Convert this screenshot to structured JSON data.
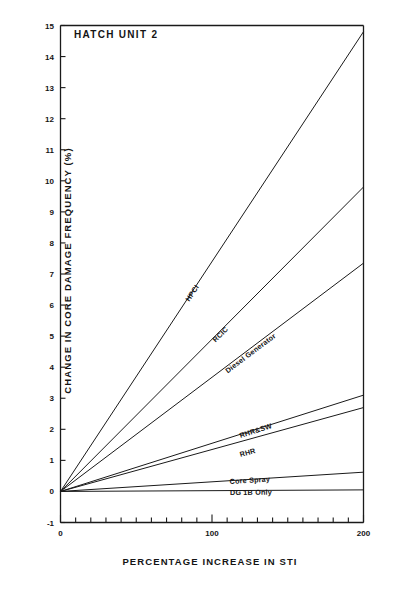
{
  "figure": {
    "plot_title": "HATCH UNIT 2",
    "x_axis_title": "PERCENTAGE INCREASE IN STI",
    "y_axis_title": "CHANGE IN CORE DAMAGE FREQUENCY  (%)",
    "line_color": "#1a1a1a",
    "axis_color": "#1a1a1a",
    "background": "#ffffff"
  },
  "chart_data": {
    "type": "line",
    "title": "HATCH UNIT 2",
    "xlabel": "PERCENTAGE INCREASE IN STI",
    "ylabel": "CHANGE IN CORE DAMAGE FREQUENCY  (%)",
    "xlim": [
      0,
      200
    ],
    "ylim": [
      -1,
      15
    ],
    "xticks": [
      0,
      100,
      200
    ],
    "xtick_labels": [
      "0",
      "100",
      "200"
    ],
    "xminor_step": 10,
    "yticks": [
      -1,
      0,
      1,
      2,
      3,
      4,
      5,
      6,
      7,
      8,
      9,
      10,
      11,
      12,
      13,
      14,
      15
    ],
    "ytick_labels": [
      "-1",
      "0",
      "1",
      "2",
      "3",
      "4",
      "5",
      "6",
      "7",
      "8",
      "9",
      "10",
      "11",
      "12",
      "13",
      "14",
      "15"
    ],
    "grid": false,
    "legend": "inline-curve-labels",
    "x": [
      0,
      200
    ],
    "series": [
      {
        "name": "HPCI",
        "label": "HPCI",
        "values": [
          0,
          14.8
        ],
        "label_x": 86,
        "label_y": 6.35
      },
      {
        "name": "RCIC",
        "label": "RCIC",
        "values": [
          0,
          9.8
        ],
        "label_x": 103,
        "label_y": 5.05
      },
      {
        "name": "Diesel Generator",
        "label": "Diesel Generator",
        "values": [
          0,
          7.35
        ],
        "label_x": 111,
        "label_y": 4.05
      },
      {
        "name": "RHR&SW",
        "label": "RHR&SW",
        "values": [
          0,
          3.1
        ],
        "label_x": 119,
        "label_y": 1.95
      },
      {
        "name": "RHR",
        "label": "RHR",
        "values": [
          0,
          2.7
        ],
        "label_x": 119,
        "label_y": 1.32
      },
      {
        "name": "Core Spray",
        "label": "Core Spray",
        "values": [
          0,
          0.62
        ],
        "label_x": 112,
        "label_y": 0.45
      },
      {
        "name": "DG 1B Only",
        "label": "DG 1B Only",
        "values": [
          0,
          0.05
        ],
        "label_x": 112,
        "label_y": 0.1
      }
    ]
  }
}
